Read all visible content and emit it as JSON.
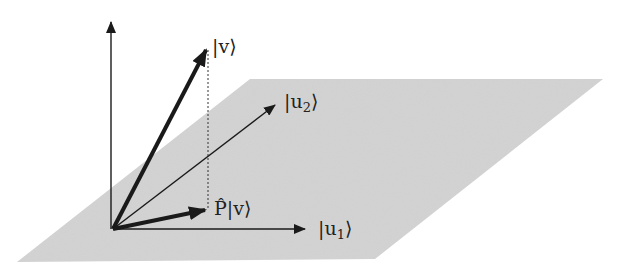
{
  "diagram": {
    "colors": {
      "plane": "#d4d4d4",
      "vector": "#1a1a1a",
      "background": "#ffffff"
    },
    "plane": {
      "points": "17,262 375,259 603,79 250,79"
    },
    "axes": {
      "vertical": {
        "x1": 111,
        "y1": 229,
        "x2": 111,
        "y2": 22
      },
      "u1": {
        "x1": 113,
        "y1": 229,
        "x2": 305,
        "y2": 229
      },
      "u2": {
        "x1": 113,
        "y1": 229,
        "x2": 275,
        "y2": 105
      }
    },
    "vectors": {
      "v": {
        "x1": 113,
        "y1": 229,
        "x2": 206,
        "y2": 50
      },
      "Pv": {
        "x1": 113,
        "y1": 229,
        "x2": 205,
        "y2": 210
      }
    },
    "projection_line": {
      "x1": 208,
      "y1": 50,
      "x2": 208,
      "y2": 210
    },
    "labels": {
      "v": {
        "ket_open": "|",
        "name": "v",
        "ket_close": "⟩"
      },
      "u2": {
        "ket_open": "|",
        "name": "u",
        "subscript": "2",
        "ket_close": "⟩"
      },
      "Pv": {
        "operator": "P̂",
        "ket_open": "|",
        "name": "v",
        "ket_close": "⟩"
      },
      "u1": {
        "ket_open": "|",
        "name": "u",
        "subscript": "1",
        "ket_close": "⟩"
      }
    }
  }
}
